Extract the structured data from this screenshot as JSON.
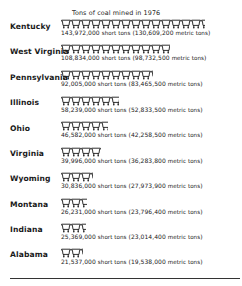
{
  "chart_data": {
    "type": "pictograph",
    "title": "Tons of coal mined in 1976",
    "unit_icon": "mine-cart-icon",
    "unit_value_short_tons": 10000000,
    "categories": [
      "Kentucky",
      "West Virginia",
      "Pennsylvania",
      "Illinois",
      "Ohio",
      "Virginia",
      "Wyoming",
      "Montana",
      "Indiana",
      "Alabama"
    ],
    "series": [
      {
        "name": "short tons",
        "values": [
          143972000,
          108834000,
          92005000,
          58239000,
          46582000,
          39996000,
          30836000,
          26231000,
          25369000,
          21537000
        ]
      },
      {
        "name": "metric tons",
        "values": [
          130609200,
          98732500,
          83465500,
          52833500,
          42258500,
          36283800,
          27973900,
          23796400,
          23014400,
          19538000
        ]
      }
    ]
  },
  "title": "Tons of coal mined in 1976",
  "rows": [
    {
      "state": "Kentucky",
      "carts": 14.4,
      "short": "143,972,000",
      "metric": "130,609,200"
    },
    {
      "state": "West Virginia",
      "carts": 10.9,
      "short": "108,834,000",
      "metric": "98,732,500"
    },
    {
      "state": "Pennsylvania",
      "carts": 9.2,
      "short": "92,005,000",
      "metric": "83,465,500"
    },
    {
      "state": "Illinois",
      "carts": 5.8,
      "short": "58,239,000",
      "metric": "52,833,500"
    },
    {
      "state": "Ohio",
      "carts": 4.7,
      "short": "46,582,000",
      "metric": "42,258,500"
    },
    {
      "state": "Virginia",
      "carts": 4.0,
      "short": "39,996,000",
      "metric": "36,283,800"
    },
    {
      "state": "Wyoming",
      "carts": 3.1,
      "short": "30,836,000",
      "metric": "27,973,900"
    },
    {
      "state": "Montana",
      "carts": 2.6,
      "short": "26,231,000",
      "metric": "23,796,400"
    },
    {
      "state": "Indiana",
      "carts": 2.5,
      "short": "25,369,000",
      "metric": "23,014,400"
    },
    {
      "state": "Alabama",
      "carts": 2.15,
      "short": "21,537,000",
      "metric": "19,538,000"
    }
  ],
  "labels": {
    "short_tons": "short tons",
    "metric_tons": "metric tons"
  }
}
